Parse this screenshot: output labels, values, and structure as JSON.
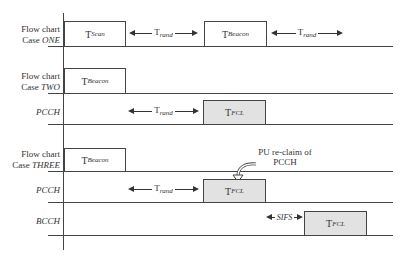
{
  "rows": [
    {
      "id": "case-one",
      "label_line1": "Flow chart",
      "label_line2_prefix": "Case ",
      "label_line2_italic": "ONE"
    },
    {
      "id": "case-two",
      "label_line1": "Flow chart",
      "label_line2_prefix": "Case ",
      "label_line2_italic": "TWO"
    },
    {
      "id": "pcch-two",
      "label_italic": "PCCH"
    },
    {
      "id": "case-three",
      "label_line1": "Flow chart",
      "label_line2_prefix": "Case ",
      "label_line2_italic": "THREE"
    },
    {
      "id": "pcch-three",
      "label_italic": "PCCH"
    },
    {
      "id": "bcch",
      "label_italic": "BCCH"
    }
  ],
  "boxes": {
    "scan": {
      "main": "T",
      "sub": "Scan"
    },
    "beacon1": {
      "main": "T",
      "sub": "Beacon"
    },
    "beacon2": {
      "main": "T",
      "sub": "Beacon"
    },
    "fcl2": {
      "main": "T",
      "sub": "FCL"
    },
    "beacon3": {
      "main": "T",
      "sub": "Beacon"
    },
    "fcl3": {
      "main": "T",
      "sub": "FCL"
    },
    "fcl_bcch": {
      "main": "T",
      "sub": "FCL"
    }
  },
  "arrows": {
    "rand1": {
      "main": "T",
      "sub": "rand"
    },
    "rand2": {
      "main": "T",
      "sub": "rand"
    },
    "rand3": {
      "main": "T",
      "sub": "rand"
    },
    "rand4": {
      "main": "T",
      "sub": "rand"
    },
    "sifs": {
      "label": "SIFS"
    }
  },
  "annotation": {
    "line1": "PU re-claim of",
    "line2": "PCCH"
  },
  "colors": {
    "line": "#444444",
    "grey_box": "#e2e2e2",
    "background": "#ffffff"
  }
}
